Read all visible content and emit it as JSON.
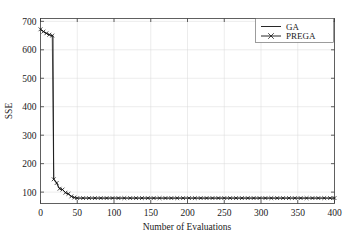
{
  "chart_data": {
    "type": "line",
    "title": "",
    "xlabel": "Number of Evaluations",
    "ylabel": "SSE",
    "xlim": [
      0,
      400
    ],
    "ylim": [
      60,
      710
    ],
    "xticks": [
      0,
      50,
      100,
      150,
      200,
      250,
      300,
      350,
      400
    ],
    "yticks": [
      100,
      200,
      300,
      400,
      500,
      600,
      700
    ],
    "xtick_labels": [
      "0",
      "50",
      "100",
      "150",
      "200",
      "250",
      "300",
      "350",
      "400"
    ],
    "ytick_labels": [
      "100",
      "200",
      "300",
      "400",
      "500",
      "600",
      "700"
    ],
    "grid": true,
    "grid_color": "#d8d8d8",
    "legend_position": "upper right",
    "line_color": "#101010",
    "marker_symbol": "x",
    "series": [
      {
        "name": "GA",
        "marker": "none",
        "x": [
          0,
          2,
          4,
          6,
          8,
          10,
          12,
          14,
          16,
          17,
          18,
          20,
          22,
          24,
          26,
          28,
          30,
          32,
          34,
          36,
          38,
          40,
          42,
          44,
          46,
          48,
          50,
          60,
          70,
          80,
          100,
          120,
          140,
          160,
          180,
          200,
          220,
          240,
          260,
          280,
          300,
          320,
          340,
          360,
          380,
          400
        ],
        "values": [
          672,
          668,
          664,
          660,
          658,
          655,
          653,
          651,
          650,
          650,
          145,
          140,
          132,
          120,
          112,
          110,
          109,
          104,
          98,
          95,
          94,
          88,
          85,
          83,
          81,
          79,
          79,
          79,
          79,
          79,
          79,
          79,
          79,
          79,
          79,
          79,
          79,
          79,
          79,
          79,
          79,
          79,
          79,
          79,
          79,
          79
        ]
      },
      {
        "name": "PREGA",
        "marker": "x",
        "x": [
          0,
          4,
          8,
          12,
          16,
          18,
          22,
          26,
          30,
          34,
          38,
          42,
          46,
          50,
          58,
          66,
          74,
          82,
          90,
          98,
          106,
          114,
          122,
          130,
          138,
          146,
          154,
          162,
          170,
          178,
          186,
          194,
          202,
          210,
          218,
          226,
          234,
          242,
          250,
          258,
          266,
          274,
          282,
          290,
          298,
          306,
          314,
          322,
          330,
          338,
          346,
          354,
          362,
          370,
          378,
          386,
          394,
          400
        ],
        "values": [
          672,
          664,
          658,
          653,
          650,
          145,
          132,
          112,
          109,
          98,
          94,
          85,
          81,
          79,
          79,
          79,
          79,
          79,
          79,
          79,
          79,
          79,
          79,
          79,
          79,
          79,
          79,
          79,
          79,
          79,
          79,
          79,
          79,
          79,
          79,
          79,
          79,
          79,
          79,
          79,
          79,
          79,
          79,
          79,
          79,
          79,
          79,
          79,
          79,
          79,
          79,
          79,
          79,
          79,
          79,
          79,
          79,
          79
        ]
      }
    ]
  },
  "legend": {
    "entries": [
      {
        "label": "GA"
      },
      {
        "label": "PREGA"
      }
    ]
  }
}
